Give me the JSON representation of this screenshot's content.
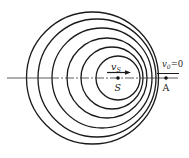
{
  "diagram": {
    "source": {
      "label": "S",
      "velocity_label": "v",
      "velocity_sub": "S",
      "x": 118,
      "y": 78
    },
    "observer": {
      "label": "A",
      "velocity_label": "v",
      "velocity_sub": "0",
      "velocity_value": "=0",
      "x": 166,
      "y": 78
    },
    "axis_y": 78,
    "wavefronts": [
      {
        "cx": 92.5,
        "r": 66
      },
      {
        "cx": 97,
        "r": 59
      },
      {
        "cx": 102,
        "r": 50
      },
      {
        "cx": 107,
        "r": 40
      },
      {
        "cx": 112,
        "r": 31
      },
      {
        "cx": 118,
        "r": 22
      }
    ],
    "colors": {
      "stroke": "#1a1a1a",
      "background": "#ffffff"
    }
  }
}
